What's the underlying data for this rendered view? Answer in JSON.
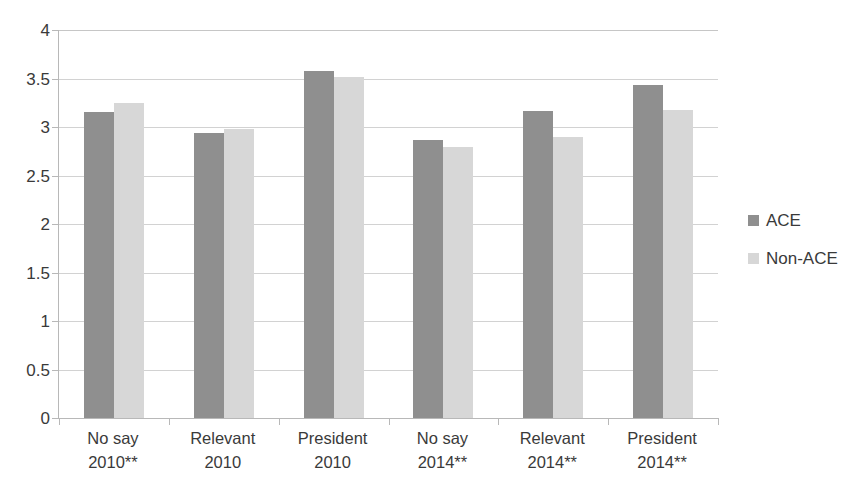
{
  "chart_data": {
    "type": "bar",
    "title": "",
    "subtitle": "",
    "xlabel": "",
    "ylabel": "",
    "ylim": [
      0,
      4
    ],
    "ytick_labels": [
      "4",
      "3.5",
      "3",
      "2.5",
      "2",
      "1.5",
      "1",
      "0.5",
      "0"
    ],
    "ytick_values": [
      4,
      3.5,
      3,
      2.5,
      2,
      1.5,
      1,
      0.5,
      0
    ],
    "grid": true,
    "legend_position": "right",
    "categories": [
      "No say\n2010**",
      "Relevant\n2010",
      "President\n2010",
      "No say\n2014**",
      "Relevant\n2014**",
      "President\n2014**"
    ],
    "series": [
      {
        "name": "ACE",
        "color": "#8f8f8f",
        "values": [
          3.15,
          2.94,
          3.58,
          2.87,
          3.17,
          3.43
        ]
      },
      {
        "name": "Non-ACE",
        "color": "#d7d7d7",
        "values": [
          3.25,
          2.98,
          3.52,
          2.79,
          2.9,
          3.18
        ]
      }
    ]
  },
  "legend": {
    "items": [
      {
        "label": "ACE",
        "color": "#8f8f8f"
      },
      {
        "label": "Non-ACE",
        "color": "#d7d7d7"
      }
    ]
  },
  "axes": {
    "x_axis_color": "#b8b8b8",
    "y_axis_color": "#b8b8b8",
    "gridline_color": "#d2d2d2"
  }
}
